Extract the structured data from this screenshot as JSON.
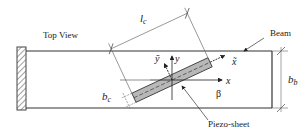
{
  "diagram": {
    "title_label": "Top View",
    "beam_label": "Beam",
    "piezo_label": "Piezo-sheet",
    "lc_label": "l",
    "lc_sub": "c",
    "bc_label": "b",
    "bc_sub": "c",
    "bb_label": "b",
    "bb_sub": "b",
    "y_label": "y",
    "ytilde_label": "ỹ",
    "x_label": "x",
    "xtilde_label": "x̃",
    "beta_label": "β"
  },
  "colors": {
    "line": "#333333",
    "thin": "#555555",
    "piezo_fill": "#b8b8b8"
  }
}
